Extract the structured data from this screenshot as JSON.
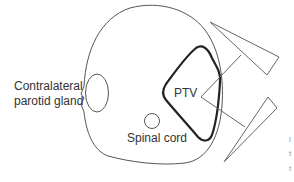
{
  "diagram": {
    "type": "radiotherapy-cross-section",
    "labels": {
      "parotid_line1": "Contralateral",
      "parotid_line2": "parotid gland",
      "ptv": "PTV",
      "spinal_cord": "Spinal cord"
    },
    "edge_fragments": [
      "l",
      "t",
      "t"
    ],
    "structures": [
      {
        "name": "body-outline",
        "stroke": "#555555"
      },
      {
        "name": "contralateral-parotid-gland",
        "stroke": "#555555"
      },
      {
        "name": "spinal-cord",
        "stroke": "#555555"
      },
      {
        "name": "ptv",
        "stroke": "#222222",
        "stroke_width": 2.2
      },
      {
        "name": "beam-upper",
        "stroke": "#666666"
      },
      {
        "name": "beam-lower",
        "stroke": "#666666"
      }
    ],
    "colors": {
      "background": "#ffffff",
      "line": "#555555",
      "ptv_line": "#222222",
      "text": "#333333"
    }
  }
}
